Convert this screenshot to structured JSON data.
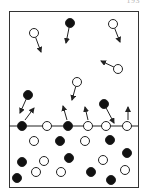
{
  "page_number": "193",
  "colors": {
    "ink": "#222222",
    "frame": "#333333",
    "filled": "#111111",
    "open_fill": "#ffffff"
  },
  "diagram": {
    "frame": {
      "x": 9,
      "y": 11,
      "width": 129,
      "height": 176
    },
    "surface_y": 126,
    "particle_radius": 4.5,
    "gas_particles": [
      {
        "x": 34,
        "y": 33,
        "type": "open",
        "arrow_to": [
          41,
          52
        ]
      },
      {
        "x": 70,
        "y": 23,
        "type": "filled",
        "arrow_to": [
          66,
          43
        ]
      },
      {
        "x": 113,
        "y": 24,
        "type": "open",
        "arrow_to": [
          120,
          42
        ]
      },
      {
        "x": 118,
        "y": 69,
        "type": "open",
        "arrow_to": [
          101,
          61
        ]
      },
      {
        "x": 77,
        "y": 82,
        "type": "open",
        "arrow_to": [
          72,
          100
        ]
      },
      {
        "x": 28,
        "y": 95,
        "type": "filled",
        "arrow_to": [
          20,
          113
        ]
      },
      {
        "x": 104,
        "y": 104,
        "type": "filled",
        "arrow_to": [
          114,
          123
        ]
      }
    ],
    "surface_particles": [
      {
        "x": 22,
        "y": 126,
        "type": "filled"
      },
      {
        "x": 47,
        "y": 126,
        "type": "open"
      },
      {
        "x": 68,
        "y": 126,
        "type": "filled"
      },
      {
        "x": 88,
        "y": 126,
        "type": "open"
      },
      {
        "x": 106,
        "y": 126,
        "type": "open"
      },
      {
        "x": 127,
        "y": 126,
        "type": "open"
      }
    ],
    "escape_arrows": [
      {
        "from": [
          25,
          120
        ],
        "to": [
          34,
          108
        ]
      },
      {
        "from": [
          67,
          120
        ],
        "to": [
          63,
          106
        ]
      },
      {
        "from": [
          88,
          120
        ],
        "to": [
          85,
          107
        ]
      },
      {
        "from": [
          128,
          120
        ],
        "to": [
          128,
          107
        ]
      }
    ],
    "liquid_particles": [
      {
        "x": 34,
        "y": 141,
        "type": "open"
      },
      {
        "x": 60,
        "y": 141,
        "type": "filled"
      },
      {
        "x": 85,
        "y": 141,
        "type": "open"
      },
      {
        "x": 110,
        "y": 140,
        "type": "filled"
      },
      {
        "x": 22,
        "y": 162,
        "type": "filled"
      },
      {
        "x": 44,
        "y": 161,
        "type": "open"
      },
      {
        "x": 69,
        "y": 158,
        "type": "filled"
      },
      {
        "x": 103,
        "y": 160,
        "type": "open"
      },
      {
        "x": 127,
        "y": 153,
        "type": "filled"
      },
      {
        "x": 17,
        "y": 178,
        "type": "filled"
      },
      {
        "x": 36,
        "y": 172,
        "type": "open"
      },
      {
        "x": 61,
        "y": 172,
        "type": "open"
      },
      {
        "x": 91,
        "y": 172,
        "type": "filled"
      },
      {
        "x": 111,
        "y": 180,
        "type": "filled"
      },
      {
        "x": 125,
        "y": 170,
        "type": "open"
      }
    ]
  }
}
